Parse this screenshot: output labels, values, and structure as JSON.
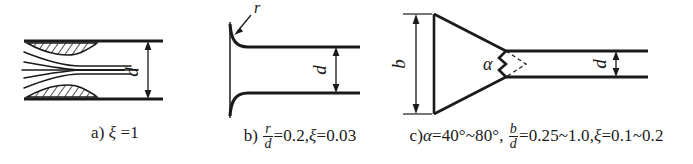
{
  "figure": {
    "background_color": "#ffffff",
    "line_color": "#1a1a1a"
  },
  "panels": [
    {
      "id": "a",
      "type": "sharp-edged-entrance",
      "caption": {
        "label": "a)",
        "symbol": "ξ",
        "equals": "=",
        "value": "1",
        "full_text": "a) ξ =1"
      },
      "dimensions": [
        {
          "name": "d",
          "symbol": "d",
          "orientation": "vertical"
        }
      ],
      "features": [
        "vena-contracta",
        "separation-zone-hatched",
        "streamlines",
        "pipe-walls"
      ]
    },
    {
      "id": "b",
      "type": "rounded-bellmouth-entrance",
      "caption": {
        "label": "b)",
        "fraction_numerator": "r",
        "fraction_denominator": "d",
        "fraction_value": "=0.2,",
        "symbol": "ξ",
        "equals": "=",
        "value": "0.03",
        "full_text": "b) r/d=0.2, ξ =0.03"
      },
      "dimensions": [
        {
          "name": "r",
          "symbol": "r",
          "orientation": "leader-arrow"
        },
        {
          "name": "d",
          "symbol": "d",
          "orientation": "vertical"
        }
      ],
      "features": [
        "fillet-radius",
        "leader-arrow",
        "pipe-walls"
      ]
    },
    {
      "id": "c",
      "type": "conical-tapered-entrance",
      "caption": {
        "label": "c)",
        "alpha_symbol": "α",
        "alpha_value": "=40°~80°,",
        "fraction_numerator": "b",
        "fraction_denominator": "d",
        "fraction_value": "=0.25~1.0,",
        "symbol": "ξ",
        "equals": "=",
        "value": "0.1~0.2",
        "full_text": "c)α=40°~80°, b/d=0.25~1.0, ξ=0.1~0.2"
      },
      "dimensions": [
        {
          "name": "b",
          "symbol": "b",
          "orientation": "vertical"
        },
        {
          "name": "d",
          "symbol": "d",
          "orientation": "vertical"
        },
        {
          "name": "alpha",
          "symbol": "α",
          "orientation": "angle"
        }
      ],
      "features": [
        "cone",
        "apex-angle",
        "dashed-apex-lines",
        "pipe-walls"
      ]
    }
  ]
}
